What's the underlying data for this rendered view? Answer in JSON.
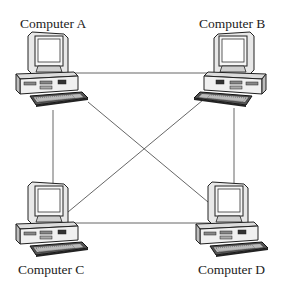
{
  "diagram": {
    "type": "mesh-network",
    "nodes": [
      {
        "id": "A",
        "label": "Computer A"
      },
      {
        "id": "B",
        "label": "Computer B"
      },
      {
        "id": "C",
        "label": "Computer C"
      },
      {
        "id": "D",
        "label": "Computer D"
      }
    ],
    "edges": [
      {
        "from": "A",
        "to": "B"
      },
      {
        "from": "A",
        "to": "C"
      },
      {
        "from": "A",
        "to": "D"
      },
      {
        "from": "B",
        "to": "C"
      },
      {
        "from": "B",
        "to": "D"
      },
      {
        "from": "C",
        "to": "D"
      }
    ],
    "colors": {
      "line": "#555555",
      "ink": "#222222",
      "background": "#ffffff"
    }
  }
}
